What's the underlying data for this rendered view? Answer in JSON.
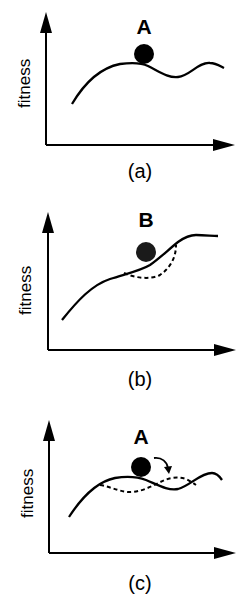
{
  "figure": {
    "panels": [
      {
        "id": "a",
        "caption": "(a)",
        "point_label": "A",
        "y_axis_label": "fitness",
        "curves": [
          "solid landscape with local peak; ball resting on peak"
        ]
      },
      {
        "id": "b",
        "caption": "(b)",
        "point_label": "B",
        "y_axis_label": "fitness",
        "curves": [
          "solid rising landscape",
          "dashed alternative dip beneath ball"
        ]
      },
      {
        "id": "c",
        "caption": "(c)",
        "point_label": "A",
        "y_axis_label": "fitness",
        "curves": [
          "solid landscape",
          "dashed shifted landscape",
          "curved arrow showing movement"
        ]
      }
    ]
  },
  "colors": {
    "ink": "#000000",
    "background": "#ffffff",
    "ball_b": "#1a1a1a"
  }
}
